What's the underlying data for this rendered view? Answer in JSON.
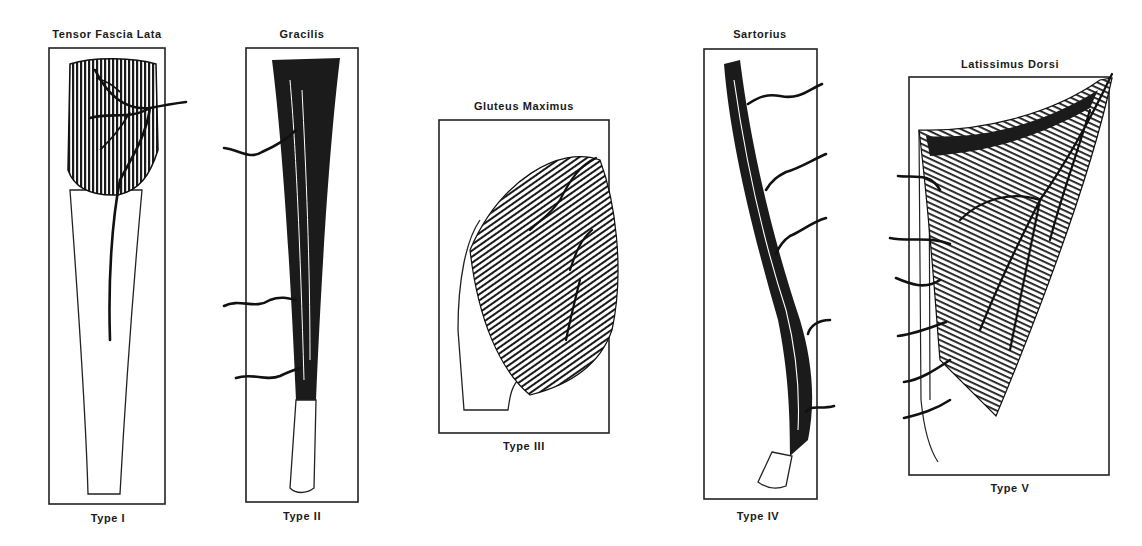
{
  "figure": {
    "panels": [
      {
        "muscle": "Tensor Fascia Lata",
        "type": "Type I"
      },
      {
        "muscle": "Gracilis",
        "type": "Type II"
      },
      {
        "muscle": "Gluteus Maximus",
        "type": "Type III"
      },
      {
        "muscle": "Sartorius",
        "type": "Type IV"
      },
      {
        "muscle": "Latissimus Dorsi",
        "type": "Type V"
      }
    ]
  },
  "colors": {
    "ink": "#1a1a1a",
    "paper": "#ffffff"
  }
}
